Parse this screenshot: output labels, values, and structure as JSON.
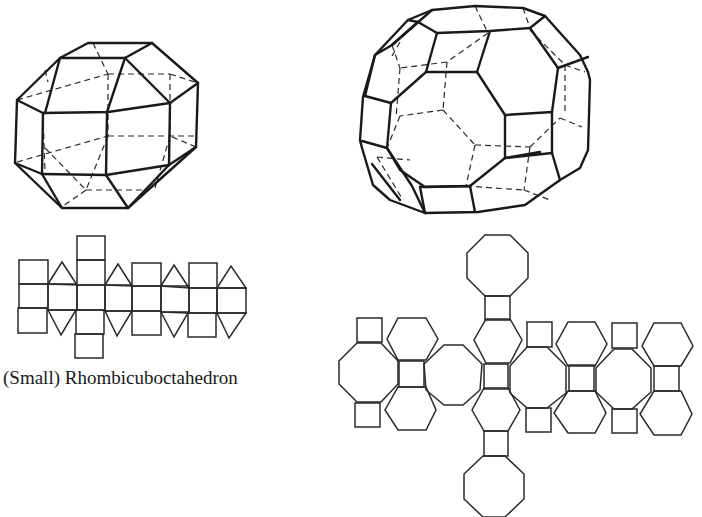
{
  "figure": {
    "left": {
      "solid_name": "rhombicuboctahedron",
      "caption": "(Small) Rhombicuboctahedron"
    },
    "right": {
      "solid_name": "truncated-cuboctahedron",
      "caption": ""
    }
  },
  "colors": {
    "line": "#1a1a1a",
    "background": "#ffffff"
  }
}
